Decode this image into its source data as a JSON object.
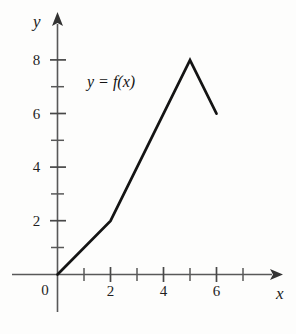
{
  "figure": {
    "axis_labels": {
      "x": "x",
      "y": "y",
      "origin": "0"
    },
    "curve_label": "y = f(x)",
    "colors": {
      "background": "#fdfdfc",
      "axis": "#5a5a5a",
      "curve": "#141414",
      "text": "#1a1a1a"
    }
  },
  "chart_data": {
    "type": "line",
    "title": "",
    "subtitle": "",
    "xlabel": "x",
    "ylabel": "y",
    "xlim": [
      -1.7,
      8.2
    ],
    "ylim": [
      -1.4,
      9.6
    ],
    "grid": false,
    "legend": null,
    "annotations": [
      {
        "text": "y = f(x)",
        "x": 1.1,
        "y": 7.2
      }
    ],
    "xticks": [
      1,
      2,
      3,
      4,
      5,
      6,
      7
    ],
    "xtick_labels": [
      "",
      "2",
      "",
      "4",
      "",
      "6",
      ""
    ],
    "yticks": [
      1,
      2,
      3,
      4,
      5,
      6,
      7,
      8
    ],
    "ytick_labels": [
      "",
      "2",
      "",
      "4",
      "",
      "6",
      "",
      "8"
    ],
    "series": [
      {
        "name": "y = f(x)",
        "x": [
          0,
          2,
          5,
          6
        ],
        "values": [
          0,
          2,
          8,
          6
        ],
        "points": [
          [
            0,
            0
          ],
          [
            2,
            2
          ],
          [
            5,
            8
          ],
          [
            6,
            6
          ]
        ]
      }
    ]
  }
}
